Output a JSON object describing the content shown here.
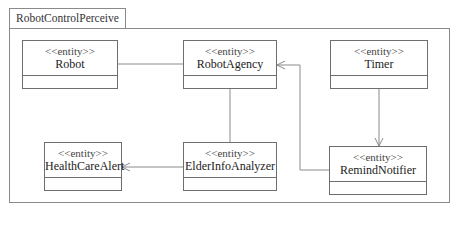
{
  "frame": {
    "title": "RobotControlPerceive"
  },
  "classes": [
    {
      "id": "robot",
      "stereotype": "<<entity>>",
      "name": "Robot"
    },
    {
      "id": "robot-agency",
      "stereotype": "<<entity>>",
      "name": "RobotAgency"
    },
    {
      "id": "timer",
      "stereotype": "<<entity>>",
      "name": "Timer"
    },
    {
      "id": "health-care-alert",
      "stereotype": "<<entity>>",
      "name": "HealthCareAlert"
    },
    {
      "id": "elder-info-analyzer",
      "stereotype": "<<entity>>",
      "name": "ElderInfoAnalyzer"
    },
    {
      "id": "remind-notifier",
      "stereotype": "<<entity>>",
      "name": "RemindNotifier"
    }
  ],
  "relations": [
    {
      "from": "Robot",
      "to": "RobotAgency",
      "type": "association"
    },
    {
      "from": "RobotAgency",
      "to": "ElderInfoAnalyzer",
      "type": "association"
    },
    {
      "from": "ElderInfoAnalyzer",
      "to": "HealthCareAlert",
      "type": "directed-association"
    },
    {
      "from": "Timer",
      "to": "RemindNotifier",
      "type": "directed-association"
    },
    {
      "from": "RemindNotifier",
      "to": "RobotAgency",
      "type": "directed-association"
    }
  ],
  "colors": {
    "line": "#8a8a8a",
    "border": "#6e6e6e"
  }
}
